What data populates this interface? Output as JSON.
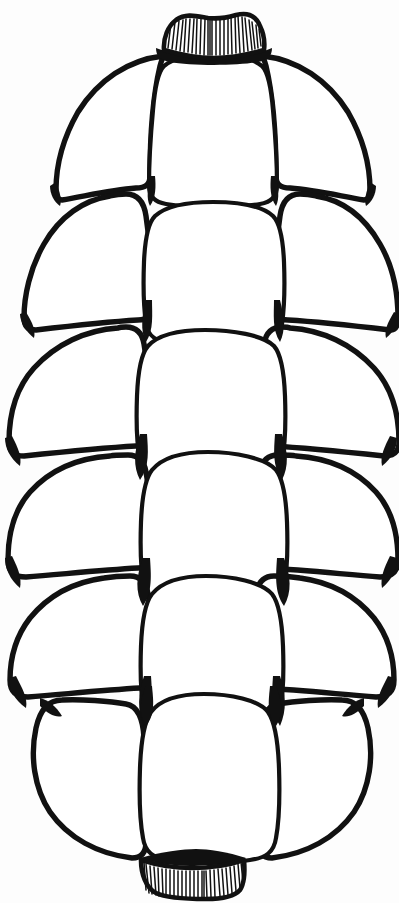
{
  "figure": {
    "kind": "botanical-line-drawing",
    "orientation": "vertical",
    "line_color": "#111111",
    "fill_color": "#ffffff",
    "background_color": "#fdfdfd",
    "width_px": 399,
    "height_px": 903
  },
  "apex_cap": {
    "label": "Apex cap with vertical striations",
    "hatch_line_count": 26,
    "x_left": 163,
    "x_right": 263,
    "y_top": 14,
    "y_bottom": 52
  },
  "base_cap": {
    "label": "Basal peduncle cap with vertical striations",
    "hatch_line_count": 27,
    "x_left": 139,
    "x_right": 243,
    "y_top": 856,
    "y_bottom": 898
  },
  "body": {
    "label": "Cone body outline",
    "leftmost_x": 8,
    "rightmost_x": 387,
    "top_y": 50,
    "bottom_y": 862,
    "widest_y": 470
  },
  "rows": [
    {
      "index": 1,
      "label": "Apex row",
      "scale_count": 3,
      "y_center": 150
    },
    {
      "index": 2,
      "label": "Second row",
      "scale_count": 3,
      "y_center": 270
    },
    {
      "index": 3,
      "label": "Third row",
      "scale_count": 3,
      "y_center": 400
    },
    {
      "index": 4,
      "label": "Fourth row",
      "scale_count": 3,
      "y_center": 520
    },
    {
      "index": 5,
      "label": "Fifth row",
      "scale_count": 3,
      "y_center": 640
    },
    {
      "index": 6,
      "label": "Sixth row",
      "scale_count": 3,
      "y_center": 750
    },
    {
      "index": 7,
      "label": "Basal row",
      "scale_count": 1,
      "y_center": 820
    }
  ],
  "scales": [
    {
      "id": "s-r1-left",
      "row": 1,
      "position": "left",
      "label": "Apex left scale"
    },
    {
      "id": "s-r1-center",
      "row": 1,
      "position": "center",
      "label": "Apex center scale"
    },
    {
      "id": "s-r1-right",
      "row": 1,
      "position": "right",
      "label": "Apex right scale"
    },
    {
      "id": "s-r2-left",
      "row": 2,
      "position": "left",
      "label": "Row 2 left scale"
    },
    {
      "id": "s-r2-center",
      "row": 2,
      "position": "center",
      "label": "Row 2 center scale"
    },
    {
      "id": "s-r2-right",
      "row": 2,
      "position": "right",
      "label": "Row 2 right scale"
    },
    {
      "id": "s-r3-left",
      "row": 3,
      "position": "left",
      "label": "Row 3 left scale"
    },
    {
      "id": "s-r3-center",
      "row": 3,
      "position": "center",
      "label": "Row 3 center scale"
    },
    {
      "id": "s-r3-right",
      "row": 3,
      "position": "right",
      "label": "Row 3 right scale"
    },
    {
      "id": "s-r4-left",
      "row": 4,
      "position": "left",
      "label": "Row 4 left scale"
    },
    {
      "id": "s-r4-center",
      "row": 4,
      "position": "center",
      "label": "Row 4 center scale"
    },
    {
      "id": "s-r4-right",
      "row": 4,
      "position": "right",
      "label": "Row 4 right scale"
    },
    {
      "id": "s-r5-left",
      "row": 5,
      "position": "left",
      "label": "Row 5 left scale"
    },
    {
      "id": "s-r5-center",
      "row": 5,
      "position": "center",
      "label": "Row 5 center scale"
    },
    {
      "id": "s-r5-right",
      "row": 5,
      "position": "right",
      "label": "Row 5 right scale"
    },
    {
      "id": "s-r6-left",
      "row": 6,
      "position": "left",
      "label": "Row 6 left scale"
    },
    {
      "id": "s-r6-center",
      "row": 6,
      "position": "center",
      "label": "Row 6 center scale"
    },
    {
      "id": "s-r6-right",
      "row": 6,
      "position": "right",
      "label": "Row 6 right scale"
    },
    {
      "id": "s-r7-center",
      "row": 7,
      "position": "center",
      "label": "Basal terminal scale"
    }
  ],
  "accessibility": {
    "alt_text": "Black ink line drawing of an ovoid pine cone seen from the side, composed of about nineteen rounded overlapping scales arranged in alternating horizontal rows, with small hatched caps at the top apex and bottom base."
  }
}
